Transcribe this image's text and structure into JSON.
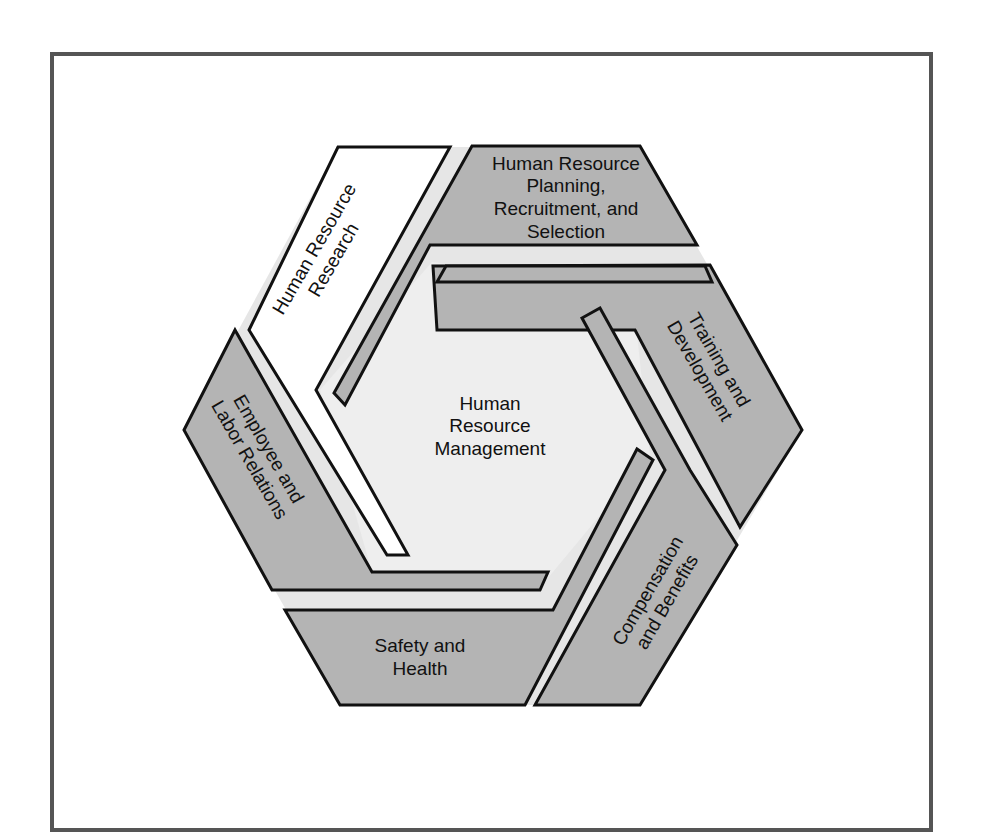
{
  "diagram": {
    "center": {
      "lines": [
        "Human",
        "Resource",
        "Management"
      ]
    },
    "segments": [
      {
        "id": "hr-research",
        "fill": "white",
        "lines": [
          "Human Resource",
          "Research"
        ]
      },
      {
        "id": "hr-planning",
        "fill": "gray",
        "lines": [
          "Human Resource",
          "Planning,",
          "Recruitment, and",
          "Selection"
        ]
      },
      {
        "id": "training",
        "fill": "gray",
        "lines": [
          "Training and",
          "Development"
        ]
      },
      {
        "id": "compensation",
        "fill": "gray",
        "lines": [
          "Compensation",
          "and Benefits"
        ]
      },
      {
        "id": "safety",
        "fill": "gray",
        "lines": [
          "Safety and",
          "Health"
        ]
      },
      {
        "id": "employee-labor",
        "fill": "gray",
        "lines": [
          "Employee and",
          "Labor Relations"
        ]
      }
    ]
  },
  "colors": {
    "segment_gray": "#b4b4b4",
    "segment_white": "#ffffff",
    "gap": "#e6e6e6",
    "center": "#eeeeee",
    "outline": "#111111",
    "frame": "#555555"
  }
}
